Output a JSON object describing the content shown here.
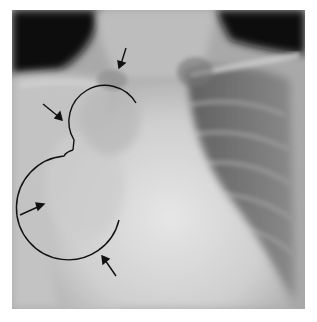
{
  "figure": {
    "annotations": {
      "arrows": [
        {
          "id": "arrow-top",
          "from": [
            126,
            48
          ],
          "to": [
            121,
            67
          ]
        },
        {
          "id": "arrow-upper-left",
          "from": [
            43,
            104
          ],
          "to": [
            62,
            120
          ]
        },
        {
          "id": "arrow-left",
          "from": [
            20,
            215
          ],
          "to": [
            43,
            205
          ]
        },
        {
          "id": "arrow-bottom",
          "from": [
            116,
            276
          ],
          "to": [
            103,
            257
          ]
        }
      ],
      "outline_color": "#111111"
    },
    "colors": {
      "background": "#ffffff",
      "air_dark": "#0a0a0a",
      "soft_tissue": "#c9c9c9",
      "lung": "#6e6e6e"
    }
  }
}
